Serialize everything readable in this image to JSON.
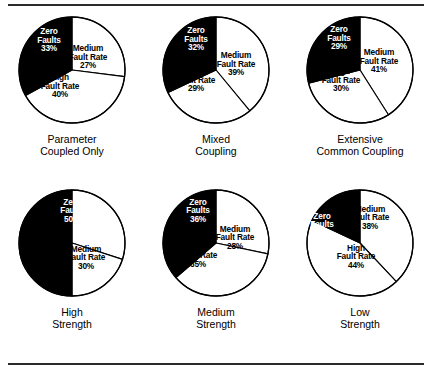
{
  "figure": {
    "rule_color": "#2b2b2b",
    "slice_fill_dark": "#000000",
    "slice_fill_light": "#ffffff",
    "slice_stroke": "#000000"
  },
  "chart_data": [
    {
      "type": "pie",
      "title": "Parameter Coupled Only",
      "caption_lines": [
        "Parameter",
        "Coupled Only"
      ],
      "categories": [
        "Zero Faults",
        "Medium Fault Rate",
        "High Fault Rate"
      ],
      "values": [
        33,
        27,
        40
      ],
      "unit": "%",
      "labels": [
        {
          "lines": [
            "Zero",
            "Faults"
          ],
          "pct": "33%",
          "tone": "on-dark",
          "x": 33,
          "y": 26
        },
        {
          "lines": [
            "Medium",
            "Fault Rate"
          ],
          "pct": "27%",
          "tone": "on-light",
          "x": 72,
          "y": 43
        },
        {
          "lines": [
            "High",
            "Fault Rate"
          ],
          "pct": "40%",
          "tone": "on-light",
          "x": 44,
          "y": 72
        }
      ]
    },
    {
      "type": "pie",
      "title": "Mixed Coupling",
      "caption_lines": [
        "Mixed",
        "Coupling"
      ],
      "categories": [
        "Zero Faults",
        "Medium Fault Rate",
        "High Fault Rate"
      ],
      "values": [
        32,
        39,
        29
      ],
      "unit": "%",
      "labels": [
        {
          "lines": [
            "Zero",
            "Faults"
          ],
          "pct": "32%",
          "tone": "on-dark",
          "x": 36,
          "y": 25
        },
        {
          "lines": [
            "Medium",
            "Fault Rate"
          ],
          "pct": "39%",
          "tone": "on-light",
          "x": 76,
          "y": 50
        },
        {
          "lines": [
            "High",
            "Fault Rate"
          ],
          "pct": "29%",
          "tone": "on-light",
          "x": 36,
          "y": 66
        }
      ]
    },
    {
      "type": "pie",
      "title": "Extensive Common Coupling",
      "caption_lines": [
        "Extensive",
        "Common Coupling"
      ],
      "categories": [
        "Zero Faults",
        "Medium Fault Rate",
        "High Fault Rate"
      ],
      "values": [
        29,
        41,
        30
      ],
      "unit": "%",
      "labels": [
        {
          "lines": [
            "Zero",
            "Faults"
          ],
          "pct": "29%",
          "tone": "on-dark",
          "x": 35,
          "y": 24
        },
        {
          "lines": [
            "Medium",
            "Fault Rate"
          ],
          "pct": "41%",
          "tone": "on-light",
          "x": 75,
          "y": 47
        },
        {
          "lines": [
            "High",
            "Fault Rate"
          ],
          "pct": "30%",
          "tone": "on-light",
          "x": 37,
          "y": 66
        }
      ]
    },
    {
      "type": "pie",
      "title": "High Strength",
      "caption_lines": [
        "High",
        "Strength"
      ],
      "categories": [
        "Zero Faults",
        "Medium Fault Rate",
        "High Fault Rate"
      ],
      "values": [
        50,
        30,
        20
      ],
      "unit": "%",
      "labels": [
        {
          "lines": [
            "Zero",
            "Faults"
          ],
          "pct": "50%",
          "tone": "on-dark",
          "x": 56,
          "y": 24
        },
        {
          "lines": [
            "Medium",
            "Fault Rate"
          ],
          "pct": "30%",
          "tone": "on-light",
          "x": 70,
          "y": 71
        },
        {
          "lines": [
            "High",
            "Fault Rate"
          ],
          "pct": "20%",
          "tone": "on-light",
          "x": 26,
          "y": 69
        }
      ]
    },
    {
      "type": "pie",
      "title": "Medium Strength",
      "caption_lines": [
        "Medium",
        "Strength"
      ],
      "categories": [
        "Zero Faults",
        "Medium Fault Rate",
        "High Fault Rate"
      ],
      "values": [
        36,
        28,
        35
      ],
      "unit": "%",
      "labels": [
        {
          "lines": [
            "Zero",
            "Faults"
          ],
          "pct": "36%",
          "tone": "on-dark",
          "x": 38,
          "y": 24
        },
        {
          "lines": [
            "Medium",
            "Fault Rate"
          ],
          "pct": "28%",
          "tone": "on-light",
          "x": 75,
          "y": 51
        },
        {
          "lines": [
            "High",
            "Fault Rate"
          ],
          "pct": "35%",
          "tone": "on-light",
          "x": 38,
          "y": 69
        }
      ]
    },
    {
      "type": "pie",
      "title": "Low Strength",
      "caption_lines": [
        "Low",
        "Strength"
      ],
      "categories": [
        "Zero Faults",
        "Medium Fault Rate",
        "High Fault Rate"
      ],
      "values": [
        18,
        38,
        44
      ],
      "unit": "%",
      "labels": [
        {
          "lines": [
            "Zero",
            "Faults"
          ],
          "pct": "18%",
          "tone": "on-dark",
          "x": 18,
          "y": 38
        },
        {
          "lines": [
            "Medium",
            "Fault Rate"
          ],
          "pct": "38%",
          "tone": "on-light",
          "x": 66,
          "y": 31
        },
        {
          "lines": [
            "High",
            "Fault Rate"
          ],
          "pct": "44%",
          "tone": "on-light",
          "x": 52,
          "y": 70
        }
      ]
    }
  ]
}
